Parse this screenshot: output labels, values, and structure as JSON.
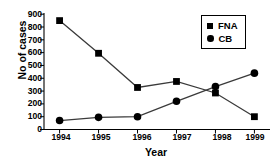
{
  "chart_data": {
    "type": "line",
    "title": "",
    "xlabel": "Year",
    "ylabel": "No of cases",
    "categories": [
      "1994",
      "1995",
      "1996",
      "1997",
      "1998",
      "1999"
    ],
    "x": [
      1994,
      1995,
      1996,
      1997,
      1998,
      1999
    ],
    "xlim": [
      1993.6,
      1999.4
    ],
    "ylim": [
      0,
      900
    ],
    "yticks": [
      900,
      800,
      700,
      600,
      500,
      400,
      300,
      200,
      100,
      0
    ],
    "ytick_labels": [
      "900",
      "800",
      "700",
      "600",
      "500",
      "400",
      "300",
      "200",
      "100",
      "0"
    ],
    "grid": false,
    "legend_position": "top-right",
    "series": [
      {
        "name": "FNA",
        "marker": "square",
        "color": "#000000",
        "values": [
          850,
          595,
          328,
          375,
          285,
          100
        ]
      },
      {
        "name": "CB",
        "marker": "circle",
        "color": "#000000",
        "values": [
          70,
          95,
          100,
          220,
          335,
          440
        ]
      }
    ]
  },
  "legend": {
    "items": [
      {
        "label": "FNA",
        "marker": "square"
      },
      {
        "label": "CB",
        "marker": "circle"
      }
    ]
  }
}
